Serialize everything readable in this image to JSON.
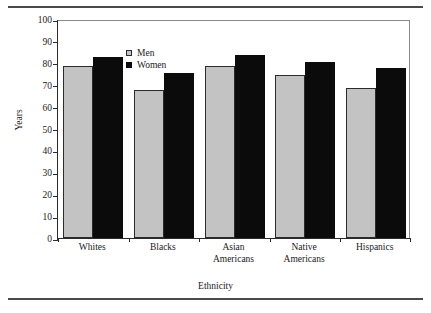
{
  "chart_data": {
    "type": "bar",
    "title": "",
    "xlabel": "Ethnicity",
    "ylabel": "Years",
    "categories": [
      "Whites",
      "Blacks",
      "Asian Americans",
      "Native Americans",
      "Hispanics"
    ],
    "series": [
      {
        "name": "Men",
        "color": "#c3c3c3",
        "values": [
          78.5,
          67.5,
          78.5,
          74.5,
          68.5
        ]
      },
      {
        "name": "Women",
        "color": "#0b0b0b",
        "values": [
          82.5,
          75.5,
          83.5,
          80.5,
          77.5
        ]
      }
    ],
    "ylim": [
      0,
      100
    ],
    "ytick_step": 10,
    "yticks": [
      0,
      10,
      20,
      30,
      40,
      50,
      60,
      70,
      80,
      90,
      100
    ],
    "ytick_labels": [
      "0",
      "10",
      "20",
      "30",
      "40",
      "50",
      "60",
      "70",
      "80",
      "90",
      "100"
    ],
    "grid": false,
    "legend_position": "top-left"
  },
  "category_lines": [
    {
      "line1": "Whites",
      "line2": ""
    },
    {
      "line1": "Blacks",
      "line2": ""
    },
    {
      "line1": "Asian",
      "line2": "Americans"
    },
    {
      "line1": "Native",
      "line2": "Americans"
    },
    {
      "line1": "Hispanics",
      "line2": ""
    }
  ],
  "colors": {
    "men_bar": "#c3c3c3",
    "women_bar": "#0b0b0b",
    "bar_outline": "#2b2b2b",
    "axis": "#2b2b2b",
    "frame": "#8a8a8a",
    "rule": "#4a4a4a",
    "text": "#1a1a1a",
    "background": "#ffffff"
  }
}
